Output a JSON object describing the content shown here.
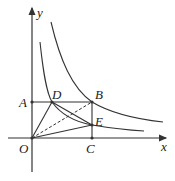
{
  "labels": {
    "y_axis": "y",
    "x_axis": "x",
    "origin": "O",
    "A": "A",
    "B": "B",
    "C": "C",
    "D": "D",
    "E": "E"
  },
  "colors": {
    "stroke": "#333333",
    "background": "#ffffff"
  }
}
